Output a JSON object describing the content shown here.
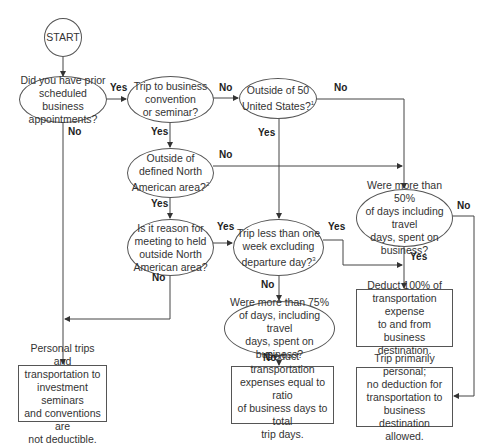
{
  "start": {
    "label": "START"
  },
  "nodes": {
    "q_prior_appointments": {
      "text": "Did you have prior\nscheduled business\nappointments?"
    },
    "q_convention": {
      "text": "Trip to business\nconvention\nor seminar?"
    },
    "q_outside_us": {
      "text": "Outside of 50\nUnited States?",
      "footnote": "1"
    },
    "q_outside_na": {
      "text": "Outside of\ndefined North\nAmerican area?",
      "footnote": "2"
    },
    "q_reason_outside_na": {
      "text": "Is it reason for\nmeeting to held\noutside North\nAmerican area?"
    },
    "q_less_than_week": {
      "text": "Trip less than one\nweek excluding\ndeparture day?",
      "footnote": "3"
    },
    "q_more_than_50": {
      "text": "Were more than 50%\nof days including travel\ndays, spent on\nbusiness?"
    },
    "q_more_than_75": {
      "text": "Were more than 75%\nof days, including travel\ndays, spent on business?"
    },
    "r_deduct_100": {
      "text": "Deduct 100% of\ntransportation expense\nto and from business\ndestination."
    },
    "r_not_deductible": {
      "text": "Personal trips and\ntransportation to\ninvestment seminars\nand conventions are\nnot deductible."
    },
    "r_deduct_ratio": {
      "text": "Deduct transportation\nexpenses equal to ratio\nof business days to total\ntrip days."
    },
    "r_primarily_personal": {
      "text": "Trip primarily personal;\nno deduction for\ntransportation to\nbusiness destination\nallowed."
    }
  },
  "edge_labels": {
    "q1_yes": "Yes",
    "q1_no": "No",
    "q2_no": "No",
    "q2_yes": "Yes",
    "q3_no": "No",
    "q3_yes": "Yes",
    "q4_no": "No",
    "q4_yes": "Yes",
    "q5_yes": "Yes",
    "q5_no": "No",
    "q6_yes": "Yes",
    "q6_no": "No",
    "q7_no": "No",
    "q7_yes": "Yes",
    "q8_no": "No"
  },
  "colors": {
    "line": "#444444",
    "text": "#333333",
    "background": "#ffffff"
  }
}
